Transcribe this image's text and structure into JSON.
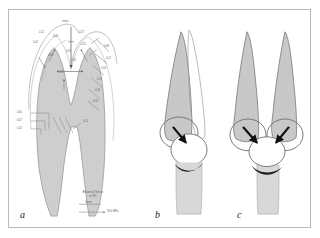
{
  "figure": {
    "type": "scientific-anatomical-diagram",
    "background_color": "#ffffff",
    "frame_color": "#b9b9b9",
    "panel_count": 3
  },
  "colors": {
    "tooth_fill": "#c9c9c9",
    "tooth_fill_light": "#d6d6d6",
    "outline": "#4a4a4a",
    "outline_light": "#9a9a9a",
    "arrow_black": "#1a1a1a",
    "label_grey": "#5f5f5f",
    "crescent_dark": "#1c1c1c"
  },
  "panels": [
    {
      "id": "a",
      "letter": "a",
      "name": "molar-cross-section-with-vectors",
      "description": "Shaded molar tooth longitudinal section with curved trajectory arcs over the crown, labelled vector arrows and a series of diagonal tick annotations along the right root, plus label leader lines at the lower left"
    },
    {
      "id": "b",
      "letter": "b",
      "name": "single-cusp-contact-diagram",
      "description": "Single shaded cusp overlapping an outlined cusp, with a rounded contact circle below marked by one black arrow and a dark crescent"
    },
    {
      "id": "c",
      "letter": "c",
      "name": "paired-cusp-contact-diagram",
      "description": "Two shaded cusps side by side above two rounded contact circles, each marked by a black arrow converging on a central circle with a dark crescent"
    }
  ],
  "panel_a": {
    "caption_lines": [
      "Bilateral Stress",
      "in PD"
    ],
    "scale_bar": {
      "upper_label": "1mm",
      "lower_label": "300 MPa"
    },
    "crown_labels": [
      {
        "text": "stress",
        "x": 53,
        "y": 11
      },
      {
        "text": "0.22",
        "x": 30,
        "y": 22
      },
      {
        "text": "0.18",
        "x": 44,
        "y": 26
      },
      {
        "text": "0.31",
        "x": 57,
        "y": 41
      },
      {
        "text": "0.42",
        "x": 24,
        "y": 32
      },
      {
        "text": "0.27",
        "x": 70,
        "y": 22
      },
      {
        "text": "0.15",
        "x": 72,
        "y": 34
      },
      {
        "text": "0.09",
        "x": 39,
        "y": 45
      },
      {
        "text": "0.24",
        "x": 62,
        "y": 50
      },
      {
        "text": "0.11",
        "x": 50,
        "y": 62
      }
    ],
    "right_tick_labels": [
      {
        "text": "0.08",
        "x": 95,
        "y": 36
      },
      {
        "text": "0.12",
        "x": 97,
        "y": 48
      },
      {
        "text": "0.16",
        "x": 92,
        "y": 58
      },
      {
        "text": "0.19",
        "x": 88,
        "y": 69
      },
      {
        "text": "0.23",
        "x": 86,
        "y": 80
      },
      {
        "text": "0.26",
        "x": 84,
        "y": 91
      }
    ],
    "left_leader_labels": [
      {
        "text": "0.05",
        "x": 10,
        "y": 103
      },
      {
        "text": "0.07",
        "x": 10,
        "y": 110
      },
      {
        "text": "0.10",
        "x": 10,
        "y": 118
      },
      {
        "text": "0.14",
        "x": 76,
        "y": 112
      }
    ]
  }
}
